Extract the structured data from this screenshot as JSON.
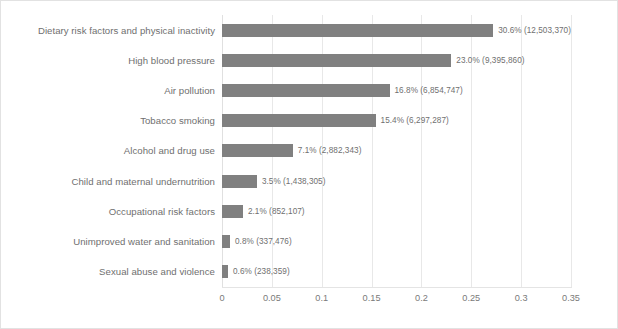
{
  "chart_data": {
    "type": "bar",
    "orientation": "horizontal",
    "title": "",
    "xlabel": "",
    "ylabel": "",
    "xlim": [
      0,
      0.35
    ],
    "grid": true,
    "legend": "none",
    "xticks": [
      "0",
      "0.05",
      "0.1",
      "0.15",
      "0.2",
      "0.25",
      "0.3",
      "0.35"
    ],
    "xtick_values": [
      0,
      0.05,
      0.1,
      0.15,
      0.2,
      0.25,
      0.3,
      0.35
    ],
    "categories": [
      "Dietary risk factors and physical inactivity",
      "High blood pressure",
      "Air pollution",
      "Tobacco smoking",
      "Alcohol and drug use",
      "Child and maternal undernutrition",
      "Occupational risk factors",
      "Unimproved water and sanitation",
      "Sexual abuse and violence"
    ],
    "values": [
      0.306,
      0.23,
      0.168,
      0.154,
      0.071,
      0.035,
      0.021,
      0.008,
      0.006
    ],
    "data_labels": [
      "30.6% (12,503,370)",
      "23.0% (9,395,860)",
      "16.8% (6,854,747)",
      "15.4% (6,297,287)",
      "7.1% (2,882,343)",
      "3.5% (1,438,305)",
      "2.1% (852,107)",
      "0.8% (337,476)",
      "0.6% (238,359)"
    ],
    "counts": [
      12503370,
      9395860,
      6854747,
      6297287,
      2882343,
      1438305,
      852107,
      337476,
      238359
    ],
    "percent_labels": [
      "30.6%",
      "23.0%",
      "16.8%",
      "15.4%",
      "7.1%",
      "3.5%",
      "2.1%",
      "0.8%",
      "0.6%"
    ],
    "bar_color": "#808080",
    "grid_color": "#e8e8e8",
    "text_color": "#6f6f6f",
    "background": "#ffffff",
    "border_color": "#e2e2e2"
  }
}
